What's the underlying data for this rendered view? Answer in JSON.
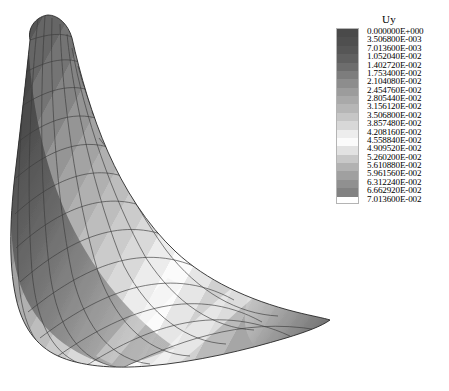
{
  "legend": {
    "title": "Uy",
    "title_icon": "contour-legend-icon",
    "colormap": "grayscale-banded",
    "orientation": "vertical",
    "band_count": 20,
    "labels": [
      "0.000000E+000",
      "3.506800E-003",
      "7.013600E-003",
      "1.052040E-002",
      "1.402720E-002",
      "1.753400E-002",
      "2.104080E-002",
      "2.454760E-002",
      "2.805440E-002",
      "3.156120E-002",
      "3.506800E-002",
      "3.857480E-002",
      "4.208160E-002",
      "4.558840E-002",
      "4.909520E-002",
      "5.260200E-002",
      "5.610880E-002",
      "5.961560E-002",
      "6.312240E-002",
      "6.662920E-002",
      "7.013600E-002"
    ],
    "band_colors": [
      "#4a4a4a",
      "#4f4f4f",
      "#565656",
      "#606060",
      "#6d6d6d",
      "#7d7d7d",
      "#8d8d8d",
      "#9c9c9c",
      "#a9a9a9",
      "#b6b6b6",
      "#c6c6c6",
      "#d8d8d8",
      "#ededed",
      "#fbfbfb",
      "#e2e2e2",
      "#c8c8c8",
      "#b2b2b2",
      "#a0a0a0",
      "#909090",
      "#828282"
    ]
  },
  "chart_data": {
    "type": "heatmap",
    "title": "Uy",
    "subtitle": "",
    "xlabel": "",
    "ylabel": "",
    "legend_position": "right",
    "grid": false,
    "colormap": "grayscale-banded",
    "field_name": "Uy",
    "field_units": "",
    "value_min": 0.0,
    "value_max": 0.070136,
    "contour_interval": 0.0035068,
    "level_count": 21,
    "levels": [
      0.0,
      0.0035068,
      0.0070136,
      0.0105204,
      0.0140272,
      0.017534,
      0.0210408,
      0.0245476,
      0.0280544,
      0.0315612,
      0.035068,
      0.0385748,
      0.0420816,
      0.0455884,
      0.0490952,
      0.052602,
      0.0561088,
      0.0596156,
      0.0631224,
      0.0666292,
      0.070136
    ],
    "mesh": {
      "element_type": "quadrilateral",
      "u_divisions": 13,
      "v_divisions": 11,
      "wireframe": true,
      "wireframe_color": "#3c3c3c"
    },
    "view": "3d-perspective-shell"
  }
}
